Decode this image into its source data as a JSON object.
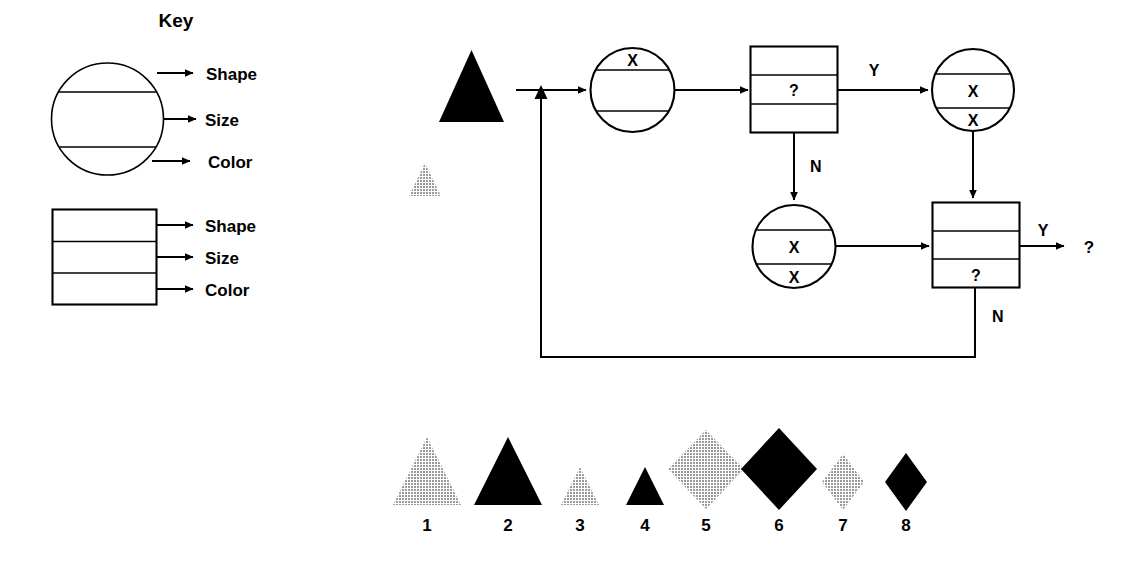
{
  "page": {
    "background": "#ffffff",
    "width": 1140,
    "height": 568
  },
  "key": {
    "title": "Key",
    "circle_legend": {
      "name": "circle-key-glyph",
      "rows": [
        "Shape",
        "Size",
        "Color"
      ]
    },
    "rect_legend": {
      "name": "rectangle-key-glyph",
      "rows": [
        "Shape",
        "Size",
        "Color"
      ]
    },
    "labels": {
      "shape": "Shape",
      "size": "Size",
      "color": "Color"
    }
  },
  "flowchart": {
    "input_shape": {
      "name": "input-triangle-black-large",
      "shape": "triangle",
      "size": "large",
      "color": "#000000"
    },
    "secondary_shape": {
      "name": "triangle-grey-small",
      "shape": "triangle",
      "size": "small",
      "color": "#a6a6a6"
    },
    "nodes": [
      {
        "id": "node-circle-1",
        "form": "circle",
        "cells": {
          "shape": "X",
          "size": "",
          "color": ""
        }
      },
      {
        "id": "node-box-1",
        "form": "rectangle",
        "cells": {
          "shape": "",
          "size": "?",
          "color": ""
        }
      },
      {
        "id": "node-circle-2",
        "form": "circle",
        "cells": {
          "shape": "",
          "size": "X",
          "color": "X"
        }
      },
      {
        "id": "node-circle-3",
        "form": "circle",
        "cells": {
          "shape": "",
          "size": "X",
          "color": "X"
        }
      },
      {
        "id": "node-box-2",
        "form": "rectangle",
        "cells": {
          "shape": "",
          "size": "",
          "color": "?"
        }
      }
    ],
    "branch_labels": {
      "box1_yes": "Y",
      "box1_no": "N",
      "box2_yes": "Y",
      "box2_no": "N"
    },
    "output_label": "?"
  },
  "gallery": {
    "items": [
      {
        "number": "1",
        "shape": "triangle",
        "size": "large",
        "color": "#a6a6a6"
      },
      {
        "number": "2",
        "shape": "triangle",
        "size": "large",
        "color": "#000000"
      },
      {
        "number": "3",
        "shape": "triangle",
        "size": "small",
        "color": "#a6a6a6"
      },
      {
        "number": "4",
        "shape": "triangle",
        "size": "small",
        "color": "#000000"
      },
      {
        "number": "5",
        "shape": "diamond",
        "size": "large",
        "color": "#a6a6a6"
      },
      {
        "number": "6",
        "shape": "diamond",
        "size": "large",
        "color": "#000000"
      },
      {
        "number": "7",
        "shape": "diamond",
        "size": "small",
        "color": "#a6a6a6"
      },
      {
        "number": "8",
        "shape": "diamond",
        "size": "small",
        "color": "#000000"
      }
    ]
  },
  "colors": {
    "black": "#000000",
    "grey": "#a6a6a6",
    "white": "#ffffff"
  }
}
